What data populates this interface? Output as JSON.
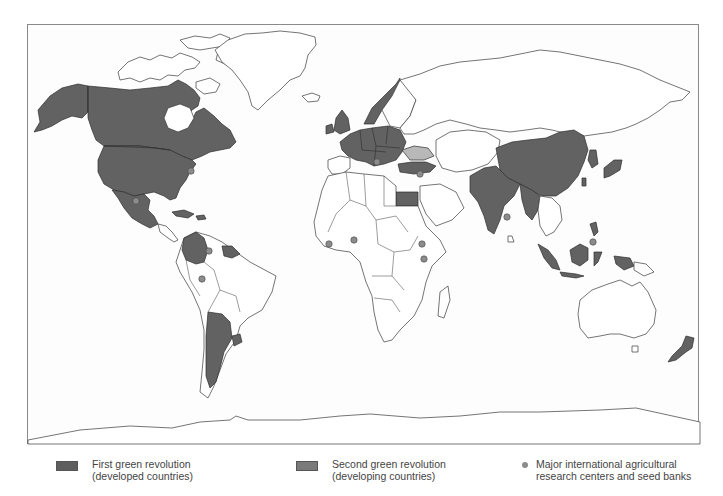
{
  "map": {
    "title": "Green revolutions world map",
    "colors": {
      "first_revolution": "#626262",
      "second_revolution": "#7a7a7a",
      "second_revolution_map_fill": "#b8b8b8",
      "no_revolution": "#ffffff",
      "research_center": "#8c8c8c",
      "outline": "#2e2e2e",
      "frame": "#8a8a8a"
    },
    "regions_first_revolution": [
      "United States",
      "Canada",
      "Alaska",
      "Western Europe",
      "Eastern Europe",
      "Norway",
      "United Kingdom",
      "Ireland",
      "Japan",
      "New Zealand",
      "Egypt",
      "Turkey",
      "South Korea"
    ],
    "regions_second_revolution": [
      "Mexico",
      "Colombia",
      "Argentina",
      "Uruguay",
      "Guyana",
      "Suriname",
      "Cuba",
      "China",
      "India",
      "Pakistan",
      "Bangladesh",
      "Myanmar",
      "Indonesia",
      "Malaysia",
      "Philippines",
      "Taiwan",
      "Sri Lanka"
    ],
    "regions_light": [
      "Ukraine"
    ]
  },
  "legend": {
    "items": [
      {
        "label_line1": "First green revolution",
        "label_line2": "(developed countries)",
        "color": "#5e5e5e",
        "type": "swatch"
      },
      {
        "label_line1": "Second green revolution",
        "label_line2": "(developing countries)",
        "color": "#7a7a7a",
        "type": "swatch"
      },
      {
        "label_line1": "Major international agricultural",
        "label_line2": "research centers and seed banks",
        "color": "#8c8c8c",
        "type": "dot"
      }
    ]
  }
}
